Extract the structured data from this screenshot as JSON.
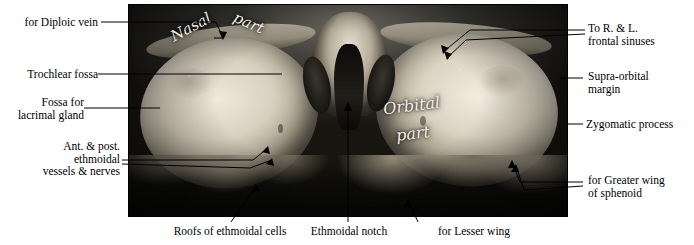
{
  "figure": {
    "plate_labels": [
      {
        "id": "nasal-part-word1",
        "text": "Nasal"
      },
      {
        "id": "nasal-part-word2",
        "text": "part"
      },
      {
        "id": "orbital-part-word1",
        "text": "Orbital"
      },
      {
        "id": "orbital-part-word2",
        "text": "part"
      }
    ],
    "labels_left": [
      {
        "id": "diploic-vein",
        "text": "for Diploic vein"
      },
      {
        "id": "trochlear-fossa",
        "text": "Trochlear fossa"
      },
      {
        "id": "lacrimal-gland-fossa",
        "text": "Fossa for\nlacrimal gland"
      },
      {
        "id": "ethmoidal-vessels-nerves",
        "text": "Ant. & post.\nethmoidal\nvessels & nerves"
      }
    ],
    "labels_right": [
      {
        "id": "frontal-sinuses",
        "text": "To R. & L.\nfrontal sinuses"
      },
      {
        "id": "supra-orbital-margin",
        "text": "Supra-orbital\nmargin"
      },
      {
        "id": "zygomatic-process",
        "text": "Zygomatic process"
      },
      {
        "id": "greater-wing-sphenoid",
        "text": "for Greater wing\nof sphenoid"
      }
    ],
    "labels_bottom": [
      {
        "id": "roofs-ethmoidal-cells",
        "text": "Roofs of ethmoidal cells"
      },
      {
        "id": "ethmoidal-notch",
        "text": "Ethmoidal notch"
      },
      {
        "id": "lesser-wing",
        "text": "for Lesser wing"
      }
    ]
  }
}
